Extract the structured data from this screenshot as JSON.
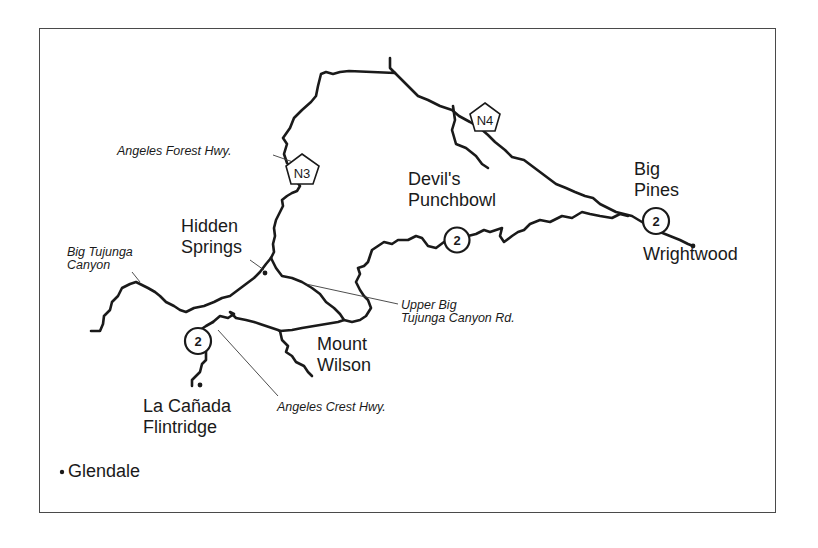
{
  "map": {
    "places": {
      "devils_punchbowl": "Devil's\nPunchbowl",
      "big_pines": "Big\nPines",
      "wrightwood": "Wrightwood",
      "hidden_springs": "Hidden\nSprings",
      "mount_wilson": "Mount\nWilson",
      "la_canada_flintridge": "La Cañada\nFlintridge",
      "glendale": "Glendale"
    },
    "roads": {
      "angeles_forest_hwy": "Angeles Forest Hwy.",
      "big_tujunga_canyon": "Big Tujunga\nCanyon",
      "upper_big_tujunga_canyon_rd": "Upper Big\nTujunga Canyon Rd.",
      "angeles_crest_hwy": "Angeles Crest Hwy."
    },
    "shields": {
      "n3": "N3",
      "n4": "N4",
      "route2_west": "2",
      "route2_mid": "2",
      "route2_east": "2"
    },
    "colors": {
      "road": "#1a1a1a",
      "frame": "#4a4a4a",
      "background": "#ffffff"
    }
  }
}
